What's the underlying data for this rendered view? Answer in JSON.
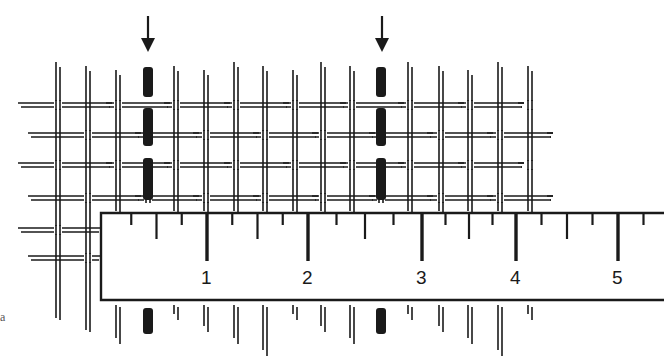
{
  "figure": {
    "panel_label": "a",
    "ink_color": "#1a1a1a",
    "background": "#ffffff"
  },
  "ruler": {
    "major_labels": [
      "1",
      "2",
      "3",
      "4",
      "5"
    ],
    "major_x": [
      207,
      308,
      422,
      516,
      618
    ],
    "minor_ticks_per_unit": 4
  },
  "arrows": [
    {
      "name": "left-arrow",
      "x": 148
    },
    {
      "name": "right-arrow",
      "x": 382
    }
  ],
  "threads": {
    "vertical_x": [
      58,
      88,
      118,
      148,
      176,
      206,
      236,
      265,
      295,
      323,
      352,
      381,
      410,
      441,
      470,
      500,
      530
    ],
    "dark_marked_x": [
      148,
      381
    ],
    "horizontal_y": [
      105,
      135,
      165,
      198,
      230,
      258
    ]
  }
}
